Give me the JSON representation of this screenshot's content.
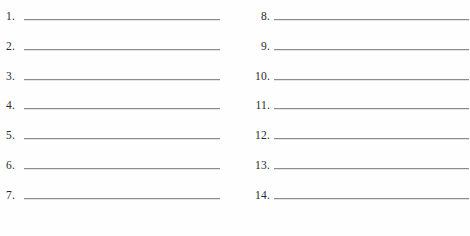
{
  "page": {
    "kind": "blank-numbered-answer-sheet",
    "background_color": "#fefefe",
    "rule_color": "#8c8c8c",
    "text_color": "#2b2b2b",
    "total_items": 14,
    "columns": 2
  },
  "left_column": {
    "name": "items-1-to-7",
    "items": [
      {
        "number": "1.",
        "value": ""
      },
      {
        "number": "2.",
        "value": ""
      },
      {
        "number": "3.",
        "value": ""
      },
      {
        "number": "4.",
        "value": ""
      },
      {
        "number": "5.",
        "value": ""
      },
      {
        "number": "6.",
        "value": ""
      },
      {
        "number": "7.",
        "value": ""
      }
    ]
  },
  "right_column": {
    "name": "items-8-to-14",
    "items": [
      {
        "number": "8.",
        "value": ""
      },
      {
        "number": "9.",
        "value": ""
      },
      {
        "number": "10.",
        "value": ""
      },
      {
        "number": "11.",
        "value": ""
      },
      {
        "number": "12.",
        "value": ""
      },
      {
        "number": "13.",
        "value": ""
      },
      {
        "number": "14.",
        "value": ""
      }
    ]
  }
}
